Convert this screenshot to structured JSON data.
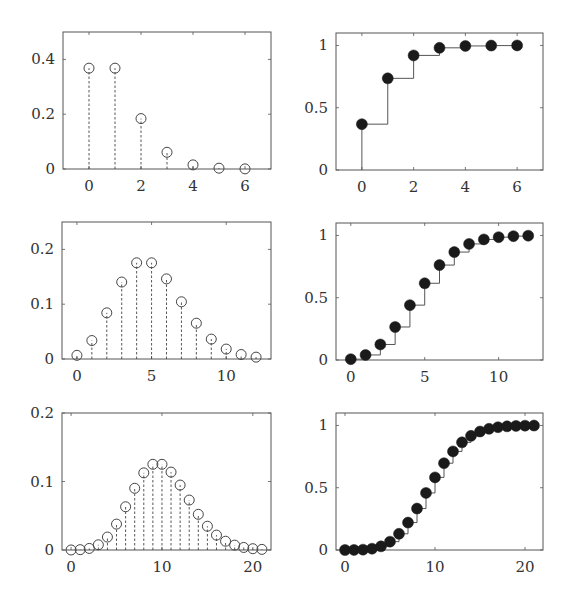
{
  "figure": {
    "colors": {
      "axis": "#555555",
      "stem": "#444444",
      "marker_open": "#444444",
      "marker_filled": "#1a1a1a",
      "step": "#555555",
      "text": "#333333"
    }
  },
  "chart_data": [
    {
      "id": "pmf-lambda1",
      "type": "stem",
      "title": "",
      "xlabel": "",
      "ylabel": "",
      "box": [
        63,
        32,
        271,
        169
      ],
      "xlim": [
        -1,
        7
      ],
      "ylim": [
        0,
        0.5
      ],
      "xticks": [
        0,
        2,
        4,
        6
      ],
      "xtick_labels": [
        "0",
        "2",
        "4",
        "6"
      ],
      "yticks": [
        0,
        0.2,
        0.4
      ],
      "ytick_labels": [
        "0",
        "0.2",
        "0.4"
      ],
      "marker": "open-circle",
      "stem_style": "dashed",
      "x": [
        0,
        1,
        2,
        3,
        4,
        5,
        6
      ],
      "y": [
        0.368,
        0.368,
        0.184,
        0.061,
        0.015,
        0.003,
        0.0005
      ]
    },
    {
      "id": "cdf-lambda1",
      "type": "step",
      "title": "",
      "xlabel": "",
      "ylabel": "",
      "box": [
        336,
        33,
        543,
        170
      ],
      "xlim": [
        -1,
        7
      ],
      "ylim": [
        0,
        1.1
      ],
      "xticks": [
        0,
        2,
        4,
        6
      ],
      "xtick_labels": [
        "0",
        "2",
        "4",
        "6"
      ],
      "yticks": [
        0,
        0.5,
        1
      ],
      "ytick_labels": [
        "0",
        "0.5",
        "1"
      ],
      "marker": "filled-circle",
      "x": [
        0,
        1,
        2,
        3,
        4,
        5,
        6
      ],
      "y": [
        0.368,
        0.736,
        0.92,
        0.981,
        0.996,
        0.999,
        1.0
      ]
    },
    {
      "id": "pmf-lambda5",
      "type": "stem",
      "title": "",
      "xlabel": "",
      "ylabel": "",
      "box": [
        62,
        222,
        271,
        359
      ],
      "xlim": [
        -1,
        13
      ],
      "ylim": [
        0,
        0.25
      ],
      "xticks": [
        0,
        5,
        10
      ],
      "xtick_labels": [
        "0",
        "5",
        "10"
      ],
      "yticks": [
        0,
        0.1,
        0.2
      ],
      "ytick_labels": [
        "0",
        "0.1",
        "0.2"
      ],
      "marker": "open-circle",
      "stem_style": "dashed",
      "x": [
        0,
        1,
        2,
        3,
        4,
        5,
        6,
        7,
        8,
        9,
        10,
        11,
        12
      ],
      "y": [
        0.0067,
        0.0337,
        0.0842,
        0.1404,
        0.1755,
        0.1755,
        0.1462,
        0.1044,
        0.0653,
        0.0363,
        0.0181,
        0.0082,
        0.0034
      ]
    },
    {
      "id": "cdf-lambda5",
      "type": "step",
      "title": "",
      "xlabel": "",
      "ylabel": "",
      "box": [
        336,
        223,
        543,
        360
      ],
      "xlim": [
        -1,
        13
      ],
      "ylim": [
        0,
        1.1
      ],
      "xticks": [
        0,
        5,
        10
      ],
      "xtick_labels": [
        "0",
        "5",
        "10"
      ],
      "yticks": [
        0,
        0.5,
        1
      ],
      "ytick_labels": [
        "0",
        "0.5",
        "1"
      ],
      "marker": "filled-circle",
      "x": [
        0,
        1,
        2,
        3,
        4,
        5,
        6,
        7,
        8,
        9,
        10,
        11,
        12
      ],
      "y": [
        0.0067,
        0.0404,
        0.1247,
        0.265,
        0.4405,
        0.616,
        0.7622,
        0.8666,
        0.9319,
        0.9682,
        0.9863,
        0.9945,
        0.998
      ]
    },
    {
      "id": "pmf-lambda10",
      "type": "stem",
      "title": "",
      "xlabel": "",
      "ylabel": "",
      "box": [
        62,
        413,
        271,
        550
      ],
      "xlim": [
        -1,
        22
      ],
      "ylim": [
        0,
        0.2
      ],
      "xticks": [
        0,
        10,
        20
      ],
      "xtick_labels": [
        "0",
        "10",
        "20"
      ],
      "yticks": [
        0,
        0.1,
        0.2
      ],
      "ytick_labels": [
        "0",
        "0.1",
        "0.2"
      ],
      "marker": "open-circle",
      "stem_style": "dashed",
      "x": [
        0,
        1,
        2,
        3,
        4,
        5,
        6,
        7,
        8,
        9,
        10,
        11,
        12,
        13,
        14,
        15,
        16,
        17,
        18,
        19,
        20,
        21
      ],
      "y": [
        5e-05,
        0.0005,
        0.0023,
        0.0076,
        0.0189,
        0.0378,
        0.0631,
        0.0901,
        0.1126,
        0.1251,
        0.1251,
        0.1137,
        0.0948,
        0.0729,
        0.0521,
        0.0347,
        0.0217,
        0.0128,
        0.0071,
        0.0037,
        0.0019,
        0.0009
      ]
    },
    {
      "id": "cdf-lambda10",
      "type": "step",
      "title": "",
      "xlabel": "",
      "ylabel": "",
      "box": [
        336,
        413,
        543,
        550
      ],
      "xlim": [
        -1,
        22
      ],
      "ylim": [
        0,
        1.1
      ],
      "xticks": [
        0,
        10,
        20
      ],
      "xtick_labels": [
        "0",
        "10",
        "20"
      ],
      "yticks": [
        0,
        0.5,
        1
      ],
      "ytick_labels": [
        "0",
        "0.5",
        "1"
      ],
      "marker": "filled-circle",
      "x": [
        0,
        1,
        2,
        3,
        4,
        5,
        6,
        7,
        8,
        9,
        10,
        11,
        12,
        13,
        14,
        15,
        16,
        17,
        18,
        19,
        20,
        21
      ],
      "y": [
        5e-05,
        0.0005,
        0.0028,
        0.0103,
        0.0293,
        0.0671,
        0.1301,
        0.2202,
        0.3328,
        0.4579,
        0.583,
        0.6968,
        0.7916,
        0.8645,
        0.9165,
        0.9513,
        0.973,
        0.9857,
        0.9928,
        0.9965,
        0.9984,
        0.9993
      ]
    }
  ]
}
